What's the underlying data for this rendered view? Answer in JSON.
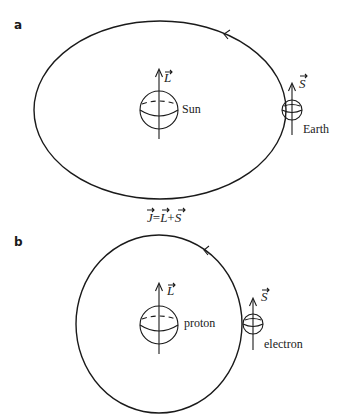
{
  "figure": {
    "panels": [
      {
        "id": "a",
        "label": "a",
        "center_body": {
          "name": "Sun",
          "vector": "L"
        },
        "orbiting_body": {
          "name": "Earth",
          "vector": "S"
        },
        "orbit_shape": "ellipse",
        "orbit_direction": "counterclockwise"
      },
      {
        "id": "b",
        "label": "b",
        "center_body": {
          "name": "proton",
          "vector": "L"
        },
        "orbiting_body": {
          "name": "electron",
          "vector": "S"
        },
        "orbit_shape": "circle",
        "orbit_direction": "counterclockwise"
      }
    ],
    "equation": {
      "lhs": "J",
      "eq": "=",
      "term1": "L",
      "plus": "+",
      "term2": "S"
    }
  },
  "colors": {
    "ink": "#1a1a1a",
    "background": "#ffffff"
  }
}
